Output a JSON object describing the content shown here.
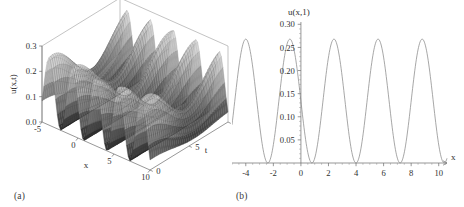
{
  "figure": {
    "panels": [
      {
        "id": "a",
        "caption": "(a)",
        "type": "surface3d"
      },
      {
        "id": "b",
        "caption": "(b)",
        "type": "line"
      }
    ]
  },
  "chart_data": [
    {
      "type": "surface",
      "panel": "a",
      "title": "",
      "xlabel": "x",
      "ylabel": "t",
      "zlabel": "u(x,t)",
      "xlim": [
        -5,
        10
      ],
      "ylim": [
        0,
        10
      ],
      "zlim": [
        0.0,
        0.3
      ],
      "xticks": [
        -5,
        0,
        5,
        10
      ],
      "xticklabels": [
        "-5",
        "0",
        "5",
        "10"
      ],
      "yticks": [
        0,
        5,
        10
      ],
      "yticklabels": [
        "0",
        "5",
        "10"
      ],
      "zticks": [
        0.0,
        0.1,
        0.2,
        0.3
      ],
      "zticklabels": [
        "0.0",
        "0.1",
        "0.2",
        "0.3"
      ],
      "grid": false,
      "legend": null,
      "description": "Dense wireframe mesh surface, oscillatory in x with period about 3.2 and modulated in t; light grey crests and dark shaded troughs",
      "surface_model": {
        "amplitude": 0.135,
        "offset": 0.135,
        "k_x": 1.963,
        "omega_t": 0.9,
        "x_samples": 64,
        "t_samples": 40
      }
    },
    {
      "type": "line",
      "panel": "b",
      "title": "",
      "xlabel": "x",
      "ylabel": "u(x,1)",
      "xlim": [
        -5,
        10.6
      ],
      "ylim": [
        0,
        0.305
      ],
      "xticks": [
        -4,
        -2,
        0,
        2,
        4,
        6,
        8,
        10
      ],
      "xticklabels": [
        "-4",
        "-2",
        "0",
        "2",
        "4",
        "6",
        "8",
        "10"
      ],
      "yticks": [
        0.05,
        0.1,
        0.15,
        0.2,
        0.25,
        0.3
      ],
      "yticklabels": [
        "0.05",
        "0.10",
        "0.15",
        "0.20",
        "0.25",
        "0.30"
      ],
      "grid": false,
      "legend": null,
      "peak_value": 0.268,
      "min_value": 0.0,
      "period": 3.2,
      "peaks_x": [
        -4.0,
        -0.8,
        2.4,
        5.6,
        8.8
      ],
      "zeros_x": [
        -5.6,
        -2.4,
        0.8,
        4.0,
        7.2,
        10.4
      ],
      "curve_model": {
        "amplitude": 0.134,
        "offset": 0.134,
        "k_x": 1.9635,
        "phase_zero_x": 0.8,
        "samples": 400
      },
      "description": "Single grey sinusoid-squared style wave, peaks at about 0.268, touching zero between peaks"
    }
  ]
}
